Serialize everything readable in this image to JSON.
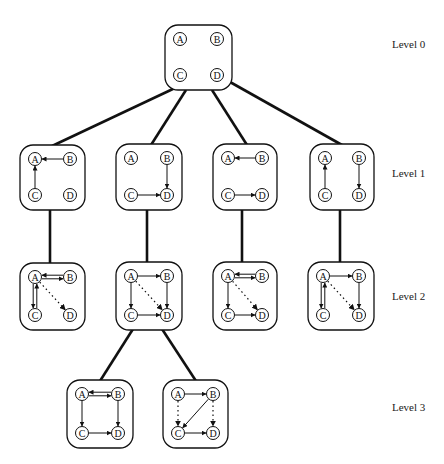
{
  "diagram": {
    "colors": {
      "stroke": "#111111",
      "background": "#ffffff"
    },
    "levels": [
      {
        "label": "Level 0",
        "y": 45
      },
      {
        "label": "Level 1",
        "y": 174
      },
      {
        "label": "Level 2",
        "y": 297
      },
      {
        "label": "Level 3",
        "y": 408
      }
    ],
    "node_labels": [
      "A",
      "B",
      "C",
      "D"
    ],
    "boxes": [
      {
        "id": "L0",
        "level": 0,
        "x": 165,
        "y": 25,
        "w": 67,
        "h": 65,
        "edges": []
      },
      {
        "id": "L1a",
        "level": 1,
        "x": 20,
        "y": 145,
        "w": 65,
        "h": 65,
        "edges": [
          {
            "from": "B",
            "to": "A",
            "style": "solid"
          },
          {
            "from": "C",
            "to": "A",
            "style": "solid"
          }
        ]
      },
      {
        "id": "L1b",
        "level": 1,
        "x": 116,
        "y": 144,
        "w": 66,
        "h": 66,
        "edges": [
          {
            "from": "B",
            "to": "D",
            "style": "solid"
          },
          {
            "from": "C",
            "to": "D",
            "style": "solid"
          }
        ]
      },
      {
        "id": "L1c",
        "level": 1,
        "x": 213,
        "y": 144,
        "w": 64,
        "h": 66,
        "edges": [
          {
            "from": "B",
            "to": "A",
            "style": "solid"
          },
          {
            "from": "C",
            "to": "D",
            "style": "solid"
          }
        ]
      },
      {
        "id": "L1d",
        "level": 1,
        "x": 310,
        "y": 144,
        "w": 64,
        "h": 66,
        "edges": [
          {
            "from": "C",
            "to": "A",
            "style": "solid"
          },
          {
            "from": "B",
            "to": "D",
            "style": "solid"
          }
        ]
      },
      {
        "id": "L2a",
        "level": 2,
        "x": 20,
        "y": 263,
        "w": 65,
        "h": 67,
        "edges": [
          {
            "from": "A",
            "to": "B",
            "style": "double"
          },
          {
            "from": "A",
            "to": "C",
            "style": "double"
          },
          {
            "from": "A",
            "to": "D",
            "style": "dotted"
          }
        ]
      },
      {
        "id": "L2b",
        "level": 2,
        "x": 116,
        "y": 262,
        "w": 66,
        "h": 68,
        "edges": [
          {
            "from": "A",
            "to": "B",
            "style": "solid"
          },
          {
            "from": "A",
            "to": "C",
            "style": "solid"
          },
          {
            "from": "B",
            "to": "D",
            "style": "solid"
          },
          {
            "from": "C",
            "to": "D",
            "style": "solid"
          },
          {
            "from": "A",
            "to": "D",
            "style": "dotted"
          }
        ]
      },
      {
        "id": "L2c",
        "level": 2,
        "x": 213,
        "y": 262,
        "w": 64,
        "h": 68,
        "edges": [
          {
            "from": "A",
            "to": "B",
            "style": "double"
          },
          {
            "from": "A",
            "to": "C",
            "style": "solid"
          },
          {
            "from": "C",
            "to": "D",
            "style": "solid"
          },
          {
            "from": "A",
            "to": "D",
            "style": "dotted"
          }
        ]
      },
      {
        "id": "L2d",
        "level": 2,
        "x": 308,
        "y": 262,
        "w": 66,
        "h": 68,
        "edges": [
          {
            "from": "A",
            "to": "B",
            "style": "solid"
          },
          {
            "from": "A",
            "to": "C",
            "style": "double"
          },
          {
            "from": "B",
            "to": "D",
            "style": "solid"
          },
          {
            "from": "A",
            "to": "D",
            "style": "dotted"
          }
        ]
      },
      {
        "id": "L3a",
        "level": 3,
        "x": 67,
        "y": 380,
        "w": 66,
        "h": 68,
        "edges": [
          {
            "from": "A",
            "to": "B",
            "style": "double"
          },
          {
            "from": "A",
            "to": "C",
            "style": "solid"
          },
          {
            "from": "B",
            "to": "D",
            "style": "solid"
          },
          {
            "from": "C",
            "to": "D",
            "style": "solid"
          }
        ]
      },
      {
        "id": "L3b",
        "level": 3,
        "x": 163,
        "y": 380,
        "w": 65,
        "h": 68,
        "edges": [
          {
            "from": "A",
            "to": "B",
            "style": "solid"
          },
          {
            "from": "B",
            "to": "C",
            "style": "solid"
          },
          {
            "from": "C",
            "to": "D",
            "style": "solid"
          },
          {
            "from": "A",
            "to": "C",
            "style": "dotted"
          },
          {
            "from": "B",
            "to": "D",
            "style": "dotted"
          }
        ]
      }
    ],
    "tree_edges": [
      {
        "from": "L0",
        "to": "L1a",
        "x1": 175,
        "y1": 88,
        "x2": 52,
        "y2": 146
      },
      {
        "from": "L0",
        "to": "L1b",
        "x1": 186,
        "y1": 90,
        "x2": 151,
        "y2": 145
      },
      {
        "from": "L0",
        "to": "L1c",
        "x1": 212,
        "y1": 90,
        "x2": 247,
        "y2": 145
      },
      {
        "from": "L0",
        "to": "L1d",
        "x1": 230,
        "y1": 82,
        "x2": 342,
        "y2": 145
      },
      {
        "from": "L1a",
        "to": "L2a",
        "x1": 50,
        "y1": 210,
        "x2": 50,
        "y2": 263
      },
      {
        "from": "L1b",
        "to": "L2b",
        "x1": 147,
        "y1": 210,
        "x2": 147,
        "y2": 262
      },
      {
        "from": "L1c",
        "to": "L2c",
        "x1": 242,
        "y1": 210,
        "x2": 242,
        "y2": 262
      },
      {
        "from": "L1d",
        "to": "L2d",
        "x1": 340,
        "y1": 210,
        "x2": 340,
        "y2": 262
      },
      {
        "from": "L2b",
        "to": "L3a",
        "x1": 133,
        "y1": 329,
        "x2": 100,
        "y2": 381
      },
      {
        "from": "L2b",
        "to": "L3b",
        "x1": 162,
        "y1": 329,
        "x2": 196,
        "y2": 381
      }
    ]
  }
}
